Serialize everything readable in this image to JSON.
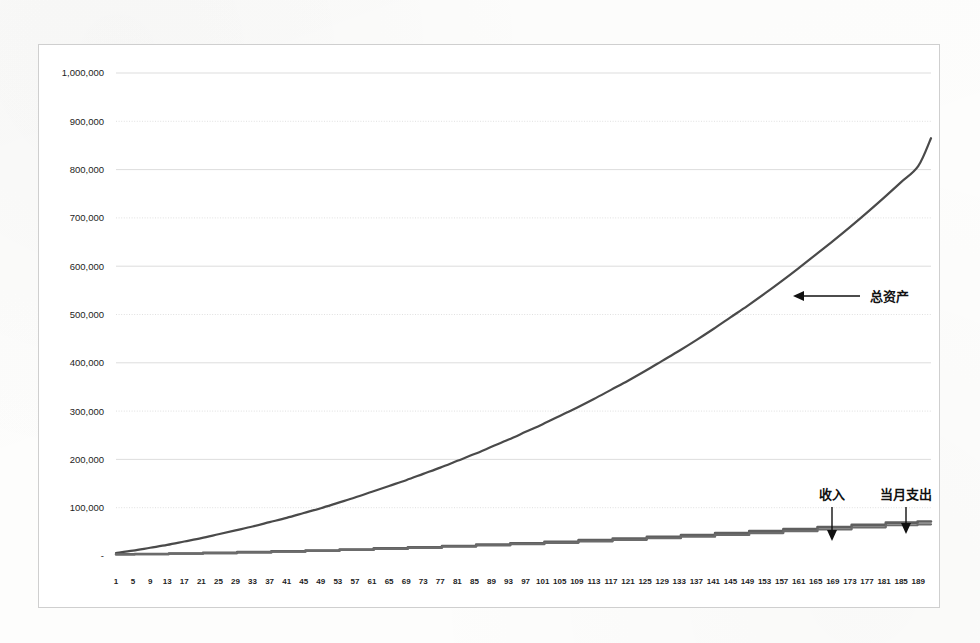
{
  "chart_data": {
    "type": "line",
    "title": "",
    "xlabel": "",
    "ylabel": "",
    "ylim": [
      0,
      1000000
    ],
    "xlim": [
      1,
      192
    ],
    "grid": true,
    "legend_position": "none",
    "y_tick_labels": [
      "1,000,000",
      "900,000",
      "800,000",
      "700,000",
      "600,000",
      "500,000",
      "400,000",
      "300,000",
      "200,000",
      "100,000",
      "-"
    ],
    "y_tick_values": [
      1000000,
      900000,
      800000,
      700000,
      600000,
      500000,
      400000,
      300000,
      200000,
      100000,
      0
    ],
    "x_tick_labels": [
      "1",
      "5",
      "9",
      "13",
      "17",
      "21",
      "25",
      "29",
      "33",
      "37",
      "41",
      "45",
      "49",
      "53",
      "57",
      "61",
      "65",
      "69",
      "73",
      "77",
      "81",
      "85",
      "89",
      "93",
      "97",
      "101",
      "105",
      "109",
      "113",
      "117",
      "121",
      "125",
      "129",
      "133",
      "137",
      "141",
      "145",
      "149",
      "153",
      "157",
      "161",
      "165",
      "169",
      "173",
      "177",
      "181",
      "185",
      "189"
    ],
    "x_tick_values": [
      1,
      5,
      9,
      13,
      17,
      21,
      25,
      29,
      33,
      37,
      41,
      45,
      49,
      53,
      57,
      61,
      65,
      69,
      73,
      77,
      81,
      85,
      89,
      93,
      97,
      101,
      105,
      109,
      113,
      117,
      121,
      125,
      129,
      133,
      137,
      141,
      145,
      149,
      153,
      157,
      161,
      165,
      169,
      173,
      177,
      181,
      185,
      189
    ],
    "series": [
      {
        "name": "总资产",
        "color": "#4a4a4a",
        "width": 2.2,
        "x": [
          1,
          5,
          9,
          13,
          17,
          21,
          25,
          29,
          33,
          37,
          41,
          45,
          49,
          53,
          57,
          61,
          65,
          69,
          73,
          77,
          81,
          85,
          89,
          93,
          97,
          101,
          105,
          109,
          113,
          117,
          121,
          125,
          129,
          133,
          137,
          141,
          145,
          149,
          153,
          157,
          161,
          165,
          169,
          173,
          177,
          181,
          185,
          189,
          192
        ],
        "values": [
          6000,
          11000,
          17000,
          23000,
          30000,
          37000,
          45000,
          53000,
          61000,
          70000,
          79000,
          89000,
          99000,
          110000,
          121000,
          133000,
          145000,
          157000,
          170000,
          183000,
          197000,
          211000,
          226000,
          241000,
          257000,
          273000,
          290000,
          307000,
          325000,
          344000,
          363000,
          383000,
          404000,
          425000,
          447000,
          470000,
          494000,
          518000,
          543000,
          569000,
          596000,
          624000,
          652000,
          681000,
          711000,
          742000,
          774000,
          807000,
          865000
        ]
      },
      {
        "name": "收入",
        "color": "#5f5f5f",
        "width": 2.6,
        "x": [
          1,
          9,
          17,
          25,
          33,
          41,
          49,
          57,
          65,
          73,
          81,
          89,
          97,
          105,
          113,
          121,
          129,
          137,
          145,
          153,
          161,
          169,
          177,
          185,
          192
        ],
        "values": [
          3500,
          4200,
          5200,
          6500,
          8000,
          9600,
          11500,
          13500,
          15800,
          18200,
          20800,
          23500,
          26500,
          29500,
          32800,
          36200,
          39800,
          43500,
          47400,
          51400,
          55600,
          59900,
          64400,
          69000,
          71500
        ]
      },
      {
        "name": "当月支出",
        "color": "#6b6b6b",
        "width": 2.2,
        "x": [
          1,
          9,
          17,
          25,
          33,
          41,
          49,
          57,
          65,
          73,
          81,
          89,
          97,
          105,
          113,
          121,
          129,
          137,
          145,
          153,
          161,
          169,
          177,
          185,
          192
        ],
        "values": [
          3200,
          3900,
          4800,
          6000,
          7400,
          8900,
          10700,
          12600,
          14700,
          16900,
          19300,
          21800,
          24500,
          27300,
          30300,
          33400,
          36700,
          40100,
          43700,
          47400,
          51300,
          55300,
          59400,
          63700,
          65500
        ]
      }
    ],
    "annotations": [
      {
        "name": "总资产",
        "label": "总资产",
        "arrow": "left"
      },
      {
        "name": "收入",
        "label": "收入",
        "arrow": "down"
      },
      {
        "name": "当月支出",
        "label": "当月支出",
        "arrow": "down"
      }
    ]
  }
}
